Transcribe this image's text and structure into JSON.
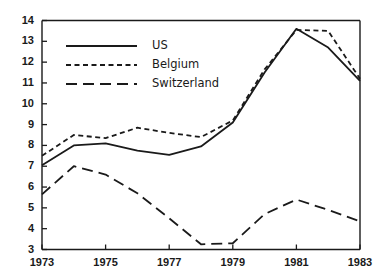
{
  "chart_data": {
    "type": "line",
    "title": "",
    "subtitle": "",
    "xlabel": "",
    "ylabel": "",
    "x": [
      1973,
      1974,
      1975,
      1976,
      1977,
      1978,
      1979,
      1980,
      1981,
      1982,
      1983
    ],
    "xlim": [
      1973,
      1983
    ],
    "ylim": [
      3,
      14
    ],
    "xticks": [
      1973,
      1975,
      1977,
      1979,
      1981,
      1983
    ],
    "xtick_labels": [
      "1973",
      "1975",
      "1977",
      "1979",
      "1981",
      "1983"
    ],
    "yticks": [
      3,
      4,
      5,
      6,
      7,
      8,
      9,
      10,
      11,
      12,
      13,
      14
    ],
    "ytick_labels": [
      "3",
      "4",
      "5",
      "6",
      "7",
      "8",
      "9",
      "10",
      "11",
      "12",
      "13",
      "14"
    ],
    "grid": false,
    "legend_position": "top-left",
    "series": [
      {
        "name": "US",
        "style": "solid",
        "color": "#1a1a1a",
        "values": [
          7.05,
          8.0,
          8.1,
          7.75,
          7.55,
          7.95,
          9.1,
          11.5,
          13.6,
          12.7,
          11.1
        ]
      },
      {
        "name": "Belgium",
        "style": "dotted",
        "color": "#1a1a1a",
        "values": [
          7.5,
          8.5,
          8.35,
          8.85,
          8.6,
          8.4,
          9.2,
          11.65,
          13.55,
          13.5,
          11.2
        ]
      },
      {
        "name": "Switzerland",
        "style": "dashed",
        "color": "#1a1a1a",
        "values": [
          5.65,
          7.0,
          6.6,
          5.7,
          4.5,
          3.25,
          3.3,
          4.7,
          5.4,
          4.9,
          4.35
        ]
      }
    ]
  },
  "legend": {
    "entries": [
      {
        "label": "US",
        "style": "solid"
      },
      {
        "label": "Belgium",
        "style": "dotted"
      },
      {
        "label": "Switzerland",
        "style": "dashed"
      }
    ]
  },
  "axes": {
    "y_axis_name": "value-axis",
    "x_axis_name": "year-axis"
  }
}
